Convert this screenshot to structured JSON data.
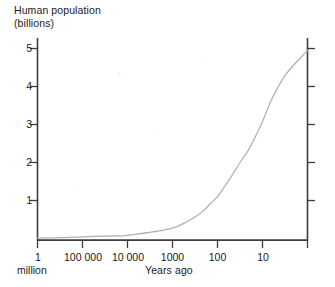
{
  "chart_data": {
    "type": "line",
    "title": "Human population (billions)",
    "title_lines": [
      "Human population",
      "(billions)"
    ],
    "ylabel": "Human population (billions)",
    "xlabel": "Years ago",
    "x_scale": "log-reversed",
    "x_tick_labels": [
      "1 million",
      "100 000",
      "10 000",
      "1000",
      "100",
      "10"
    ],
    "x_tick_values": [
      1000000,
      100000,
      10000,
      1000,
      100,
      10
    ],
    "x_tick_label_main": [
      "1",
      "100 000",
      "10 000",
      "1000",
      "100",
      "10"
    ],
    "x_tick_label_sub": "million",
    "xlim": [
      1000000,
      1
    ],
    "y_tick_labels": [
      "1",
      "2",
      "3",
      "4",
      "5"
    ],
    "y_tick_values": [
      1,
      2,
      3,
      4,
      5
    ],
    "ylim": [
      0,
      5.3
    ],
    "grid": false,
    "legend": false,
    "series": [
      {
        "name": "Human population",
        "x": [
          1000000,
          300000,
          100000,
          30000,
          10000,
          3000,
          1000,
          500,
          300,
          200,
          150,
          100,
          70,
          50,
          30,
          20,
          12,
          10,
          6,
          3,
          1
        ],
        "values": [
          0.05,
          0.06,
          0.08,
          0.1,
          0.12,
          0.2,
          0.3,
          0.45,
          0.6,
          0.75,
          0.9,
          1.1,
          1.35,
          1.6,
          2.0,
          2.3,
          2.8,
          3.0,
          3.6,
          4.2,
          4.8
        ]
      }
    ],
    "annotations": []
  },
  "colors": {
    "axis": "#3c3c3c",
    "curve": "#b0b0b0",
    "text": "#1a1a1a",
    "background": "#ffffff"
  }
}
